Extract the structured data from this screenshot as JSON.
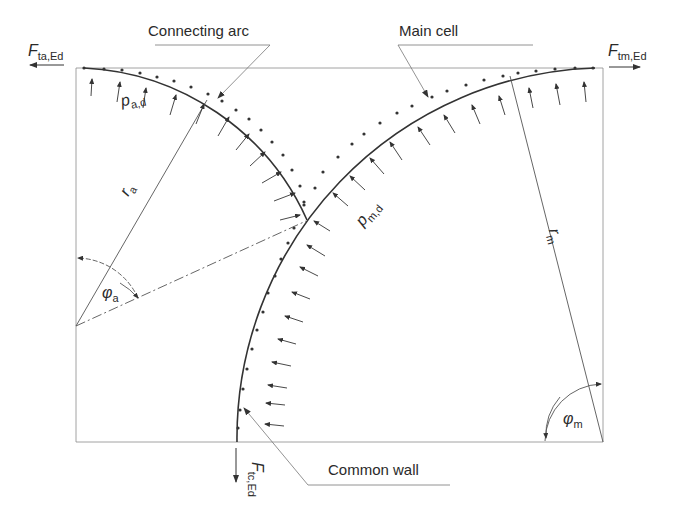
{
  "diagram": {
    "callouts": {
      "connecting_arc": "Connecting arc",
      "main_cell": "Main cell",
      "common_wall": "Common wall"
    },
    "forces": {
      "f_ta": {
        "symbol": "F",
        "subscript": "ta,Ed"
      },
      "f_tm": {
        "symbol": "F",
        "subscript": "tm,Ed"
      },
      "f_tc": {
        "symbol": "F",
        "subscript": "tc,Ed"
      }
    },
    "pressures": {
      "p_a": {
        "symbol": "p",
        "subscript": "a,d"
      },
      "p_m": {
        "symbol": "p",
        "subscript": "m,d"
      }
    },
    "radii": {
      "r_a": {
        "symbol": "r",
        "subscript": "a"
      },
      "r_m": {
        "symbol": "r",
        "subscript": "m"
      }
    },
    "angles": {
      "phi_a": {
        "symbol": "φ",
        "subscript": "a"
      },
      "phi_m": {
        "symbol": "φ",
        "subscript": "m"
      }
    },
    "colors": {
      "line": "#555555",
      "arc": "#333333",
      "text": "#2a2a2a"
    }
  }
}
